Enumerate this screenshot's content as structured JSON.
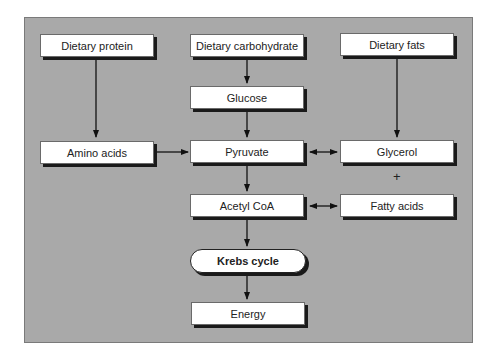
{
  "diagram": {
    "title": "",
    "nodes": {
      "dietary_protein": {
        "label": "Dietary protein"
      },
      "dietary_carbohydrate": {
        "label": "Dietary carbohydrate"
      },
      "dietary_fats": {
        "label": "Dietary fats"
      },
      "glucose": {
        "label": "Glucose"
      },
      "amino_acids": {
        "label": "Amino acids"
      },
      "pyruvate": {
        "label": "Pyruvate"
      },
      "glycerol": {
        "label": "Glycerol"
      },
      "plus": {
        "label": "+"
      },
      "acetyl_coa": {
        "label": "Acetyl CoA"
      },
      "fatty_acids": {
        "label": "Fatty acids"
      },
      "krebs_cycle": {
        "label": "Krebs cycle"
      },
      "energy": {
        "label": "Energy"
      }
    },
    "edges": [
      {
        "from": "Dietary protein",
        "to": "Amino acids",
        "type": "one-way"
      },
      {
        "from": "Dietary carbohydrate",
        "to": "Glucose",
        "type": "one-way"
      },
      {
        "from": "Dietary fats",
        "to": "Glycerol",
        "type": "one-way"
      },
      {
        "from": "Glucose",
        "to": "Pyruvate",
        "type": "one-way"
      },
      {
        "from": "Amino acids",
        "to": "Pyruvate",
        "type": "one-way"
      },
      {
        "from": "Pyruvate",
        "to": "Glycerol",
        "type": "two-way"
      },
      {
        "from": "Pyruvate",
        "to": "Acetyl CoA",
        "type": "one-way"
      },
      {
        "from": "Acetyl CoA",
        "to": "Fatty acids",
        "type": "two-way"
      },
      {
        "from": "Acetyl CoA",
        "to": "Krebs cycle",
        "type": "one-way"
      },
      {
        "from": "Krebs cycle",
        "to": "Energy",
        "type": "one-way"
      }
    ],
    "colors": {
      "panel": "#a9a9a9",
      "box": "#ffffff",
      "shadow": "#1a1a1a",
      "arrow": "#111111"
    }
  }
}
